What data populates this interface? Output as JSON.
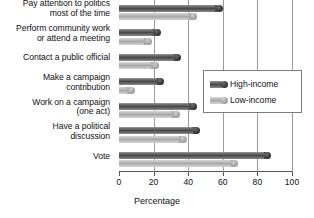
{
  "chart_data": {
    "type": "bar",
    "orientation": "horizontal",
    "title": "",
    "xlabel": "Percentage",
    "ylabel": "",
    "xlim": [
      0,
      100
    ],
    "xticks": [
      0,
      20,
      40,
      60,
      80,
      100
    ],
    "grid": true,
    "legend_position": "center-right",
    "categories": [
      "Pay attention to politics\nmost of the time",
      "Perform community work\nor attend a meeting",
      "Contact a public official",
      "Make a campaign\ncontribution",
      "Work on a campaign\n(one act)",
      "Have a political\ndiscussion",
      "Vote"
    ],
    "series": [
      {
        "name": "High-income",
        "color": "#4a4a4a",
        "values": [
          58,
          22,
          34,
          24,
          43,
          45,
          86
        ]
      },
      {
        "name": "Low-income",
        "color": "#c4c4c4",
        "values": [
          43,
          17,
          21,
          7,
          33,
          37,
          67
        ]
      }
    ]
  },
  "legend": {
    "items": [
      {
        "label": "High-income"
      },
      {
        "label": "Low-income"
      }
    ]
  },
  "axis": {
    "x_title": "Percentage",
    "tick_labels": [
      "0",
      "20",
      "40",
      "60",
      "80",
      "100"
    ]
  }
}
